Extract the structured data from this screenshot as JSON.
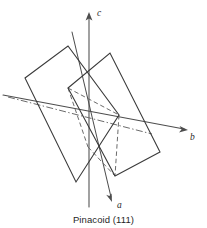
{
  "figure": {
    "caption": "Pinacoid (111)",
    "axes": [
      {
        "name": "c-axis",
        "label": "c",
        "direction": "up",
        "label_x": 97,
        "label_y": 16
      },
      {
        "name": "b-axis",
        "label": "b",
        "direction": "right",
        "label_x": 190,
        "label_y": 140
      },
      {
        "name": "a-axis",
        "label": "a",
        "direction": "down-right",
        "label_x": 117,
        "label_y": 208
      }
    ],
    "colors": {
      "background": "#ffffff",
      "axis": "#4d4d4d",
      "solid_edge": "#3a3a3a",
      "hidden_edge": "#6b6b6b",
      "text": "#1f1f1f"
    },
    "faces": [
      {
        "name": "rear-pinacoid-face",
        "style": "solid",
        "points": "25,78 68,46 119,115 76,182"
      },
      {
        "name": "front-pinacoid-face",
        "style": "solid",
        "points": "68,88 110,53 160,152 115,176"
      }
    ],
    "hidden_lines": [
      {
        "name": "hidden-edge-1",
        "style": "dashed",
        "points": "68,88 119,115"
      },
      {
        "name": "hidden-edge-2",
        "style": "dashed",
        "points": "119,115 115,176"
      },
      {
        "name": "hidden-edge-3",
        "style": "dashed",
        "points": "68,88 88,147"
      },
      {
        "name": "hidden-edge-4",
        "style": "dashed",
        "points": "88,147 115,176"
      },
      {
        "name": "center-dashdot-line",
        "style": "dashdot",
        "points": "8,97 152,134"
      }
    ]
  }
}
